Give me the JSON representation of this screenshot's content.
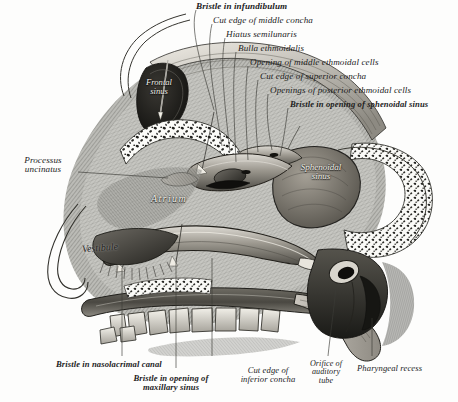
{
  "figure": {
    "style": "grayscale anatomical engraving",
    "background_color": "#fdfdfc",
    "ink_color": "#1c1c1c"
  },
  "labels_top": [
    {
      "text": "Bristle in infundibulum",
      "bold_lead": true
    },
    {
      "text": "Cut edge of middle concha",
      "bold_lead": false
    },
    {
      "text": "Hiatus semilunaris",
      "bold_lead": false
    },
    {
      "text": "Bulla ethmoidalis",
      "bold_lead": false
    },
    {
      "text": "Opening of middle ethmoidal cells",
      "bold_lead": false
    },
    {
      "text": "Cut edge of superior concha",
      "bold_lead": false
    },
    {
      "text": "Openings of posterior ethmoidal cells",
      "bold_lead": false
    },
    {
      "text": "Bristle in opening of sphenoidal sinus",
      "bold_lead": true
    }
  ],
  "labels_left": [
    {
      "line1": "Processus",
      "line2": "uncinatus"
    }
  ],
  "labels_bottom": [
    {
      "text": "Bristle in nasolacrimal canal",
      "bold_lead": true
    },
    {
      "line1": "Bristle in opening of",
      "line2": "maxillary sinus",
      "bold_lead": true
    },
    {
      "line1": "Cut edge of",
      "line2": "inferior concha",
      "bold_lead": false
    },
    {
      "line1": "Orifice of",
      "line2": "auditory",
      "line3": "tube",
      "bold_lead": false
    },
    {
      "text": "Pharyngeal recess",
      "bold_lead": false
    }
  ],
  "in_figure_labels": [
    {
      "line1": "Frontal",
      "line2": "sinus",
      "tone": "light"
    },
    {
      "line1": "Sphenoidal",
      "line2": "sinus",
      "tone": "light"
    },
    {
      "line1": "Atrium",
      "line2": "",
      "tone": "light"
    },
    {
      "line1": "Vestibule",
      "line2": "",
      "tone": "dark"
    }
  ]
}
